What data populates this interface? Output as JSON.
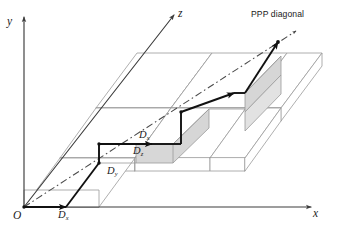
{
  "figure": {
    "background": "#ffffff",
    "colors": {
      "axis": "#3c3c3c",
      "block_edge": "#9a9a9a",
      "block_face": "#ffffff",
      "shaded_face": "#d6d6d6",
      "path": "#111111",
      "diagonal": "#4a4a4a",
      "text": "#1a1a1a"
    }
  },
  "axes": [
    {
      "id": "y",
      "label": "y",
      "direction": "up",
      "arrow": true
    },
    {
      "id": "z",
      "label": "z",
      "direction": "up-right",
      "arrow": true
    },
    {
      "id": "x",
      "label": "x",
      "direction": "right",
      "arrow": true
    }
  ],
  "origin": {
    "label": "O"
  },
  "annotations": {
    "ppp_diagonal": {
      "label": "PPP diagonal",
      "line_style": "dash-dot",
      "arrow": true
    }
  },
  "dimension_labels": [
    {
      "id": "d-x-axis",
      "base": "D",
      "sub": "x",
      "meaning": "block extent along x on the x-axis"
    },
    {
      "id": "d-y-edge",
      "base": "D",
      "sub": "y",
      "meaning": "block extent along y"
    },
    {
      "id": "d-x-face",
      "base": "D",
      "sub": "x",
      "meaning": "block extent along x on the top face"
    },
    {
      "id": "d-z-face",
      "base": "D",
      "sub": "z",
      "meaning": "block extent along z on the front face"
    }
  ],
  "grid": {
    "columns": 3,
    "rows": 3,
    "arrangement": "staircase",
    "description": "3 x 3 arrangement of rectangular blocks stepped diagonally"
  },
  "path": {
    "name": "staircase-traversal",
    "style": "bold polyline with arrowheads",
    "segments": 6,
    "arrowheads": 4
  }
}
